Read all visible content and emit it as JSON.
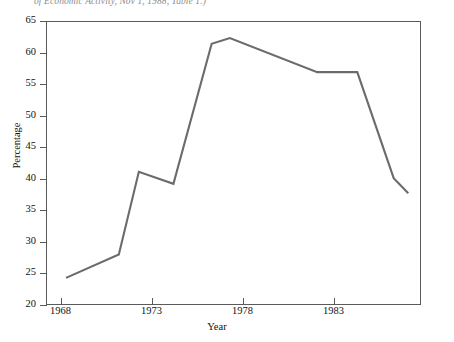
{
  "figure": {
    "caption_fragment": "of Economic Activity, Nov 1, 1988, Table 1.)"
  },
  "chart_data": {
    "type": "line",
    "title": "",
    "xlabel": "Year",
    "ylabel": "Percentage",
    "xlim": [
      1967.2,
      1987.8
    ],
    "ylim": [
      20,
      65
    ],
    "yticks": [
      20,
      25,
      30,
      35,
      40,
      45,
      50,
      55,
      60,
      65
    ],
    "xticks": [
      1968,
      1973,
      1978,
      1983
    ],
    "xtick_labels": [
      "1968",
      "1973",
      "1978",
      "1983"
    ],
    "grid": false,
    "legend": "none",
    "line_color": "#6b6b6b",
    "series": [
      {
        "name": "Percentage",
        "x": [
          1968.3,
          1971.2,
          1972.3,
          1974.2,
          1976.3,
          1977.3,
          1982.1,
          1984.3,
          1986.3,
          1987.1
        ],
        "values": [
          24.3,
          28.0,
          41.1,
          39.2,
          61.4,
          62.3,
          56.9,
          56.9,
          40.1,
          37.7
        ]
      }
    ]
  }
}
